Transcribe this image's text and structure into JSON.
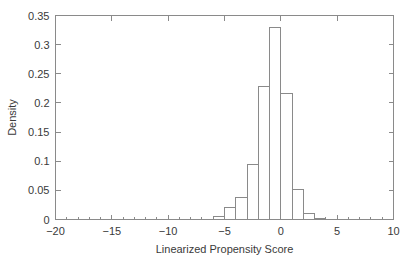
{
  "chart_data": {
    "type": "bar",
    "title": "",
    "subtitle": "",
    "xlabel": "Linearized Propensity Score",
    "ylabel": "Density",
    "xlim": [
      -20,
      10
    ],
    "ylim": [
      0,
      0.35
    ],
    "grid": false,
    "legend": null,
    "xticks": [
      "-20",
      "-15",
      "-10",
      "-5",
      "0",
      "5",
      "10"
    ],
    "xtick_values": [
      -20,
      -15,
      -10,
      -5,
      0,
      5,
      10
    ],
    "yticks": [
      "0",
      "0.05",
      "0.1",
      "0.15",
      "0.2",
      "0.25",
      "0.3",
      "0.35"
    ],
    "ytick_values": [
      0,
      0.05,
      0.1,
      0.15,
      0.2,
      0.25,
      0.3,
      0.35
    ],
    "bin_width": 1,
    "bin_edges": [
      -6,
      -5,
      -4,
      -3,
      -2,
      -1,
      0,
      1,
      2,
      3,
      4
    ],
    "categories": [
      "-6 to -5",
      "-5 to -4",
      "-4 to -3",
      "-3 to -2",
      "-2 to -1",
      "-1 to 0",
      "0 to 1",
      "1 to 2",
      "2 to 3",
      "3 to 4"
    ],
    "values": [
      0.005,
      0.021,
      0.037,
      0.094,
      0.229,
      0.329,
      0.217,
      0.052,
      0.01,
      0.002
    ],
    "bar_color": "#ffffff",
    "bar_edge_color": "#8a8a8a",
    "axis_color": "#8a8a8a",
    "text_color": "#3a3a3a"
  },
  "axes": {
    "x_title": "Linearized Propensity Score",
    "y_title": "Density"
  }
}
